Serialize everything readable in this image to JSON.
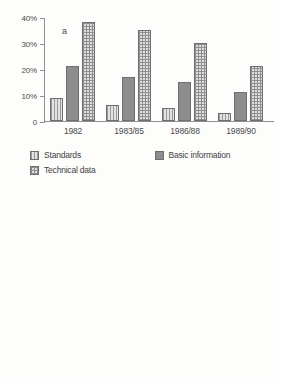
{
  "chart_data": [
    {
      "type": "bar",
      "panel": "a",
      "title": "",
      "xlabel": "",
      "ylabel": "",
      "ylim": [
        0,
        40
      ],
      "grid": false,
      "legend_position": "below",
      "ytick_labels": [
        "40%",
        "30%",
        "20%",
        "10%",
        "0"
      ],
      "ytick_values": [
        40,
        30,
        20,
        10,
        0
      ],
      "categories": [
        "1982",
        "1983/85",
        "1986/88",
        "1989/90"
      ],
      "series": [
        {
          "name": "Standards",
          "pattern": "vertical-lines",
          "color": "#e2e2e2",
          "values": [
            9,
            6,
            5,
            3
          ]
        },
        {
          "name": "Basic information",
          "pattern": "solid-gray",
          "color": "#8d8d8d",
          "values": [
            21,
            17,
            15,
            11
          ]
        },
        {
          "name": "Technical data",
          "pattern": "checker",
          "color": "#dedede",
          "values": [
            38,
            35,
            30,
            21
          ]
        }
      ]
    },
    {
      "type": "bar",
      "panel": "b",
      "title": "",
      "xlabel": "",
      "ylabel": "",
      "ylim": [
        0,
        40
      ],
      "grid": false,
      "legend_position": "below",
      "ytick_labels": [
        "40%",
        "40%",
        "20%",
        "10%",
        "0"
      ],
      "ytick_values": [
        40,
        30,
        20,
        10,
        0
      ],
      "categories": [
        "1982",
        "1983/85",
        "1986/88",
        "1989/90"
      ],
      "series": [
        {
          "name": "Artificial intelligence",
          "pattern": "mid-gray",
          "color": "#a8a8a8",
          "values": [
            1.5,
            2,
            2,
            3
          ]
        },
        {
          "name": "Workstations",
          "pattern": "solid-gray",
          "color": "#8d8d8d",
          "values": [
            4,
            11.5,
            12,
            13
          ]
        },
        {
          "name": "Economic / legal issues",
          "pattern": "light",
          "color": "#f2f2f2",
          "values": [
            6.5,
            4,
            8,
            12.5
          ]
        },
        {
          "name": "Clinical applications",
          "pattern": "checker",
          "color": "#dedede",
          "values": [
            19.5,
            24,
            39.5,
            40
          ]
        }
      ]
    }
  ],
  "panel_a": {
    "letter": "a",
    "yticks": [
      {
        "label": "40%",
        "value": 40
      },
      {
        "label": "30%",
        "value": 30
      },
      {
        "label": "20%",
        "value": 20
      },
      {
        "label": "10%",
        "value": 10
      },
      {
        "label": "0",
        "value": 0
      }
    ],
    "xlabels": [
      "1982",
      "1983/85",
      "1986/88",
      "1989/90"
    ],
    "legend": [
      {
        "label": "Standards",
        "swatch": "vertical-lines-swatch"
      },
      {
        "label": "Basic information",
        "swatch": "solid-gray-swatch"
      },
      {
        "label": "Technical data",
        "swatch": "checker-swatch"
      }
    ]
  },
  "panel_b": {
    "letter": "b",
    "yticks": [
      {
        "label": "40%",
        "value": 40
      },
      {
        "label": "40%",
        "value": 30
      },
      {
        "label": "20%",
        "value": 20
      },
      {
        "label": "10%",
        "value": 10
      },
      {
        "label": "0",
        "value": 0
      }
    ],
    "xlabels": [
      "1982",
      "1983/85",
      "1986/88",
      "1989/90"
    ],
    "legend": [
      {
        "label": "Artificial intelligence",
        "swatch": "mid-gray-swatch"
      },
      {
        "label": "Workstations",
        "swatch": "solid-gray-swatch"
      },
      {
        "label": "Economic / legal issues",
        "swatch": "light-swatch"
      },
      {
        "label": "Clinical applications",
        "swatch": "checker-swatch"
      }
    ]
  }
}
